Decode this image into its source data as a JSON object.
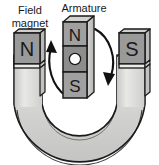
{
  "figure": {
    "title_visible": false,
    "background_color": "#ffffff",
    "stroke_color": "#1a1a1a",
    "width": 159,
    "height": 165
  },
  "labels": {
    "field_magnet_line1": "Field",
    "field_magnet_line2": "magnet",
    "armature": "Armature"
  },
  "field_magnet": {
    "left_pole_letter": "N",
    "right_pole_letter": "S",
    "pole_face_color": "#9a9a9a",
    "body_color": "#d4d4d2",
    "body_highlight_color": "#ebebe9",
    "shaft_color": "#d8d8d6"
  },
  "armature": {
    "top_letter": "N",
    "bottom_letter": "S",
    "axle_label": "",
    "block_color": "#a0a0a0",
    "middle_color": "#8d8d8d",
    "axle_color": "#ffffff",
    "side_color": "#c8c8c6"
  },
  "rotation": {
    "left_arrow_direction": "up",
    "right_arrow_direction": "down",
    "sense": "clockwise",
    "arrow_color": "#111111"
  }
}
